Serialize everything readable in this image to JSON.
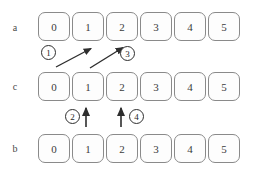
{
  "figure": {
    "type": "array-swap-diagram",
    "rows": [
      {
        "label": "a",
        "label_y": 22,
        "row_y": 12,
        "cells": [
          "0",
          "1",
          "2",
          "3",
          "4",
          "5"
        ]
      },
      {
        "label": "c",
        "label_y": 81,
        "row_y": 72,
        "cells": [
          "0",
          "1",
          "2",
          "3",
          "4",
          "5"
        ]
      },
      {
        "label": "b",
        "label_y": 143,
        "row_y": 134,
        "cells": [
          "0",
          "1",
          "2",
          "3",
          "4",
          "5"
        ]
      }
    ],
    "steps": [
      {
        "number": "1",
        "x": 41,
        "y": 45,
        "kind": "diagonal-arrow"
      },
      {
        "number": "2",
        "x": 65,
        "y": 109,
        "kind": "vertical-arrow"
      },
      {
        "number": "3",
        "x": 120,
        "y": 46,
        "kind": "diagonal-arrow"
      },
      {
        "number": "4",
        "x": 129,
        "y": 109,
        "kind": "vertical-arrow"
      }
    ],
    "colors": {
      "cell_border": "#8a8a8a",
      "cell_fill": "#fdfdfd",
      "text": "#3b3b3b",
      "arrow": "#2e2e2e",
      "badge_border": "#2e2e2e",
      "background": "#ffffff"
    }
  }
}
